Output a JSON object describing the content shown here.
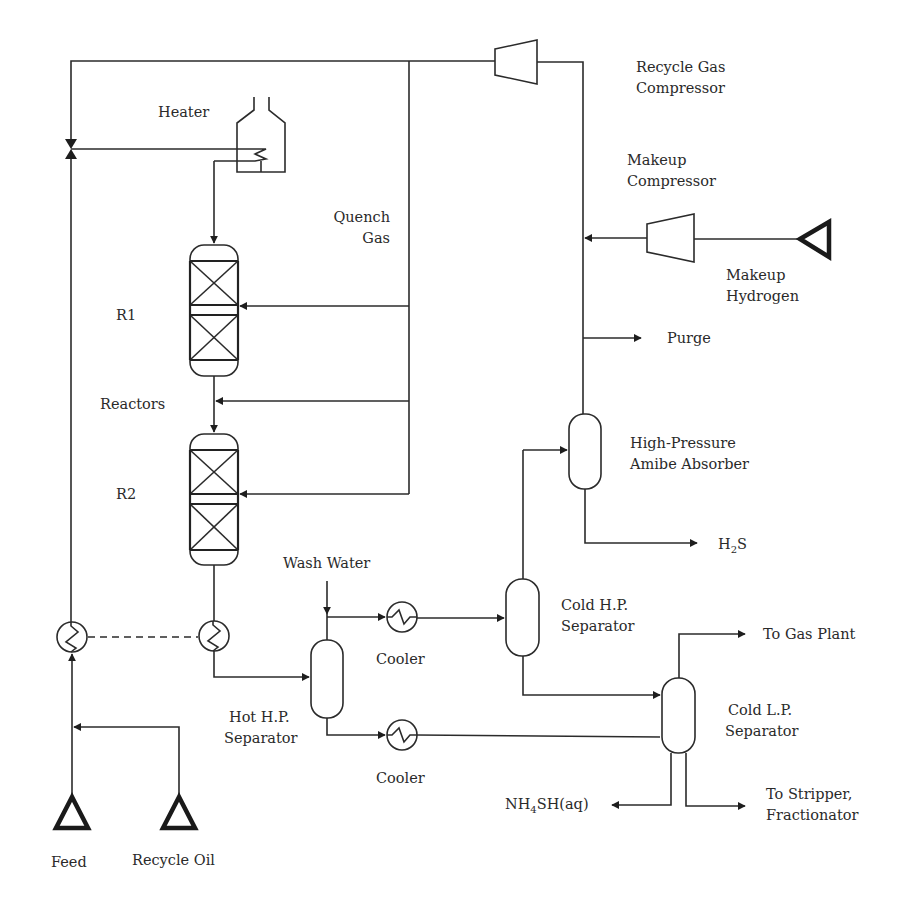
{
  "diagram": {
    "type": "process-flow-diagram",
    "title_cutoff_visible": false,
    "labels": {
      "recycle_gas_compressor": [
        "Recycle Gas",
        "Compressor"
      ],
      "heater": "Heater",
      "makeup_compressor": [
        "Makeup",
        "Compressor"
      ],
      "quench_gas": [
        "Quench",
        "Gas"
      ],
      "makeup_hydrogen": [
        "Makeup",
        "Hydrogen"
      ],
      "r1": "R1",
      "purge": "Purge",
      "reactors": "Reactors",
      "hp_amine_absorber": [
        "High-Pressure",
        "Amibe Absorber"
      ],
      "r2": "R2",
      "h2s": {
        "pre": "H",
        "sub": "2",
        "post": "S"
      },
      "wash_water": "Wash Water",
      "cold_hp_separator": [
        "Cold H.P.",
        "Separator"
      ],
      "to_gas_plant": "To Gas Plant",
      "cooler_1": "Cooler",
      "hot_hp_separator": [
        "Hot H.P.",
        "Separator"
      ],
      "cold_lp_separator": [
        "Cold L.P.",
        "Separator"
      ],
      "cooler_2": "Cooler",
      "nh4sh": {
        "pre": "NH",
        "sub": "4",
        "post": "SH(aq)"
      },
      "to_stripper": [
        "To Stripper,",
        "Fractionator"
      ],
      "feed": "Feed",
      "recycle_oil": "Recycle Oil"
    },
    "equipment": [
      {
        "id": "recycle-gas-compressor",
        "type": "compressor"
      },
      {
        "id": "makeup-compressor",
        "type": "compressor"
      },
      {
        "id": "heater",
        "type": "fired-heater"
      },
      {
        "id": "r1",
        "type": "reactor",
        "beds": 2
      },
      {
        "id": "r2",
        "type": "reactor",
        "beds": 2
      },
      {
        "id": "feed-effluent-exchanger-cold",
        "type": "heat-exchanger"
      },
      {
        "id": "feed-effluent-exchanger-hot",
        "type": "heat-exchanger"
      },
      {
        "id": "hot-hp-separator",
        "type": "vessel"
      },
      {
        "id": "cold-hp-separator",
        "type": "vessel"
      },
      {
        "id": "cold-lp-separator",
        "type": "vessel"
      },
      {
        "id": "hp-amine-absorber",
        "type": "vessel"
      },
      {
        "id": "cooler-1",
        "type": "heat-exchanger"
      },
      {
        "id": "cooler-2",
        "type": "heat-exchanger"
      },
      {
        "id": "feed-source",
        "type": "source-triangle"
      },
      {
        "id": "recycle-oil-source",
        "type": "source-triangle"
      },
      {
        "id": "makeup-hydrogen-source",
        "type": "source-triangle"
      }
    ]
  }
}
